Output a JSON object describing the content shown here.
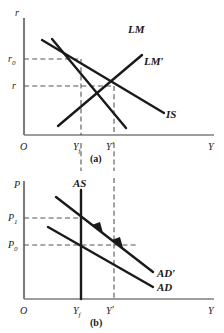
{
  "figure": {
    "background_color": "#ffffff",
    "ink_color": "#1a1a1a",
    "dash_color": "#555555"
  },
  "panel_a": {
    "caption": "(a)",
    "y_axis_label": "r",
    "x_axis_label": "Y",
    "origin_label": "O",
    "y_ticks": [
      {
        "key": "r0",
        "base": "r",
        "sub": "0",
        "value_y": 59
      },
      {
        "key": "r",
        "base": "r",
        "sub": "",
        "value_y": 86
      }
    ],
    "x_ticks": [
      {
        "key": "Yf",
        "base": "Y",
        "sub": "f",
        "prime": "",
        "value_x": 81
      },
      {
        "key": "Yprime",
        "base": "Y",
        "sub": "",
        "prime": "′",
        "value_x": 114
      }
    ],
    "curves": [
      {
        "name": "LM",
        "label": "LM",
        "slope": "upward",
        "x1": 52,
        "y1": 39,
        "x2": 126,
        "y2": 128
      },
      {
        "name": "LM-prime",
        "label": "LM′",
        "slope": "upward",
        "x1": 58,
        "y1": 126,
        "x2": 142,
        "y2": 55
      },
      {
        "name": "IS",
        "label": "IS",
        "slope": "downward",
        "x1": 42,
        "y1": 40,
        "x2": 164,
        "y2": 113
      }
    ],
    "curve_labels": [
      {
        "name": "LM",
        "text": "LM",
        "x": 128,
        "y": 32
      },
      {
        "name": "LM-prime",
        "text": "LM′",
        "x": 144,
        "y": 64
      },
      {
        "name": "IS",
        "text": "IS",
        "x": 166,
        "y": 117
      }
    ],
    "equilibria": [
      {
        "name": "initial-equilibrium",
        "x": 81,
        "y": 59
      },
      {
        "name": "new-equilibrium",
        "x": 114,
        "y": 86
      }
    ]
  },
  "panel_b": {
    "caption": "(b)",
    "y_axis_label": "P",
    "x_axis_label": "Y",
    "origin_label": "O",
    "y_ticks": [
      {
        "key": "P1",
        "base": "P",
        "sub": "1",
        "value_y": 218
      },
      {
        "key": "P0",
        "base": "P",
        "sub": "0",
        "value_y": 245
      }
    ],
    "x_ticks": [
      {
        "key": "Yf",
        "base": "Y",
        "sub": "f",
        "prime": "",
        "value_x": 81
      },
      {
        "key": "Yprime",
        "base": "Y",
        "sub": "",
        "prime": "′",
        "value_x": 114
      }
    ],
    "curves": [
      {
        "name": "AS",
        "label": "AS",
        "slope": "vertical",
        "x1": 81,
        "y1": 190,
        "x2": 81,
        "y2": 299
      },
      {
        "name": "AD-prime",
        "label": "AD′",
        "slope": "downward",
        "x1": 56,
        "y1": 197,
        "x2": 153,
        "y2": 272
      },
      {
        "name": "AD",
        "label": "AD",
        "slope": "downward",
        "x1": 48,
        "y1": 227,
        "x2": 153,
        "y2": 287
      }
    ],
    "curve_labels": [
      {
        "name": "AS",
        "text": "AS",
        "x": 76,
        "y": 186
      },
      {
        "name": "AD-prime",
        "text": "AD′",
        "x": 157,
        "y": 275
      },
      {
        "name": "AD",
        "text": "AD",
        "x": 157,
        "y": 289
      }
    ],
    "equilibria": [
      {
        "name": "short-run-equilibrium",
        "x": 81,
        "y": 218
      },
      {
        "name": "initial-equilibrium",
        "x": 81,
        "y": 245
      }
    ],
    "adjustment_arrows": [
      {
        "name": "adjustment-arrow-upper",
        "x": 98,
        "y": 228
      },
      {
        "name": "adjustment-arrow-lower",
        "x": 118,
        "y": 243
      }
    ]
  }
}
